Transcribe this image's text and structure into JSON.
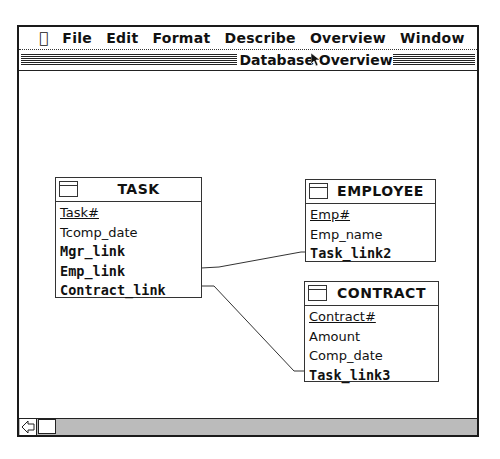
{
  "menubar": {
    "apple_icon": "apple-icon",
    "items": [
      "File",
      "Edit",
      "Format",
      "Describe",
      "Overview",
      "Window"
    ]
  },
  "window": {
    "title": "Database Overview"
  },
  "entities": [
    {
      "name": "TASK",
      "fields": [
        {
          "label": "Task#",
          "style": "key"
        },
        {
          "label": "Tcomp_date",
          "style": "normal"
        },
        {
          "label": "Mgr_link",
          "style": "bold"
        },
        {
          "label": "Emp_link",
          "style": "bold"
        },
        {
          "label": "Contract_link",
          "style": "bold"
        }
      ]
    },
    {
      "name": "EMPLOYEE",
      "fields": [
        {
          "label": "Emp#",
          "style": "key"
        },
        {
          "label": "Emp_name",
          "style": "normal"
        },
        {
          "label": "Task_link2",
          "style": "bold"
        }
      ]
    },
    {
      "name": "CONTRACT",
      "fields": [
        {
          "label": "Contract#",
          "style": "key"
        },
        {
          "label": "Amount",
          "style": "normal"
        },
        {
          "label": "Comp_date",
          "style": "normal"
        },
        {
          "label": "Task_link3",
          "style": "bold"
        }
      ]
    }
  ],
  "links": [
    {
      "from": "TASK.Emp_link",
      "to": "EMPLOYEE.Task_link2"
    },
    {
      "from": "TASK.Contract_link",
      "to": "CONTRACT.Task_link3"
    }
  ],
  "scrollbar": {
    "left_arrow_icon": "scroll-left-arrow-icon"
  }
}
